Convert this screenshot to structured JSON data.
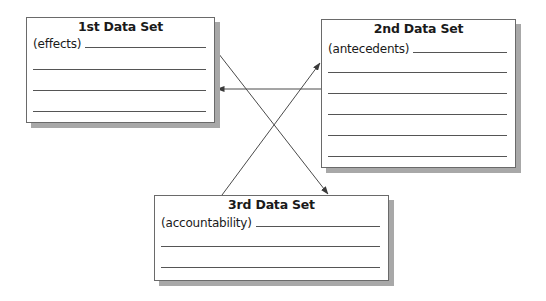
{
  "diagram": {
    "boxes": [
      {
        "id": "box1",
        "title": "1st Data Set",
        "subtitle": "(effects)",
        "blank_lines": 3
      },
      {
        "id": "box2",
        "title": "2nd Data Set",
        "subtitle": "(antecedents)",
        "blank_lines": 5
      },
      {
        "id": "box3",
        "title": "3rd Data Set",
        "subtitle": "(accountability)",
        "blank_lines": 2
      }
    ],
    "arrows": [
      {
        "from": "1st Data Set",
        "to": "3rd Data Set"
      },
      {
        "from": "3rd Data Set",
        "to": "2nd Data Set"
      },
      {
        "from": "2nd Data Set",
        "to": "1st Data Set"
      }
    ],
    "colors": {
      "line": "#555555",
      "border": "#6a6a6a",
      "shadow": "#a8a8a8",
      "text": "#1a1a1a"
    }
  }
}
